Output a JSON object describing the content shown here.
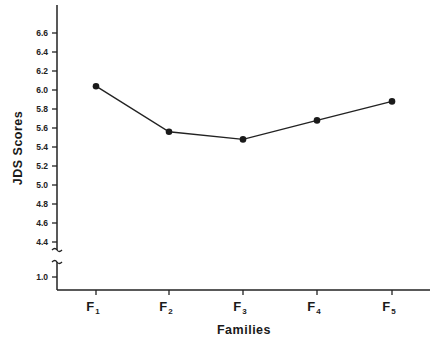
{
  "chart_data": {
    "type": "line",
    "title": "",
    "xlabel": "Families",
    "ylabel": "JDS  Scores",
    "categories": [
      "F1",
      "F2",
      "F3",
      "F4",
      "F5"
    ],
    "category_display": [
      {
        "main": "F",
        "sub": "1"
      },
      {
        "main": "F",
        "sub": "2"
      },
      {
        "main": "F",
        "sub": "3"
      },
      {
        "main": "F",
        "sub": "4"
      },
      {
        "main": "F",
        "sub": "5"
      }
    ],
    "series": [
      {
        "name": "JDS Scores",
        "values": [
          6.04,
          5.56,
          5.48,
          5.68,
          5.88
        ]
      }
    ],
    "yticks": [
      "6.6",
      "6.4",
      "6.2",
      "6.0",
      "5.8",
      "5.6",
      "5.4",
      "5.2",
      "5.0",
      "4.8",
      "4.6",
      "4.4",
      "1.0"
    ],
    "ylim": [
      1.0,
      6.8
    ],
    "axis_break": "between 1.0 and 4.4",
    "grid": false,
    "legend": "none"
  }
}
